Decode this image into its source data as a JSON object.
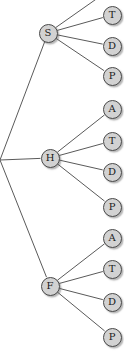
{
  "diagram": {
    "type": "tree",
    "orientation": "left-to-right",
    "canvas": {
      "width": 124,
      "height": 353
    },
    "style": {
      "background_color": "#ffffff",
      "node_fill_color": "#d2d2d2",
      "node_border_color": "#4a4a4a",
      "node_label_color": "#1a1a1a",
      "edge_color": "#5a5a5a",
      "edge_width": 1,
      "node_radius": 9.5,
      "shadow_color": "#5a5a5a"
    },
    "root": {
      "name": "root-junction",
      "visible": false,
      "x": 0,
      "y": 160
    },
    "nodes": [
      {
        "id": "S",
        "label": "S",
        "x": 48,
        "y": 33,
        "level": 1,
        "visible": true,
        "parent": "root-junction"
      },
      {
        "id": "H",
        "label": "H",
        "x": 50,
        "y": 158,
        "level": 1,
        "visible": true,
        "parent": "root-junction"
      },
      {
        "id": "F",
        "label": "F",
        "x": 50,
        "y": 286,
        "level": 1,
        "visible": true,
        "parent": "root-junction"
      },
      {
        "id": "S-A",
        "label": "A",
        "x": 112,
        "y": -12,
        "level": 2,
        "visible": false,
        "parent": "S"
      },
      {
        "id": "S-T",
        "label": "T",
        "x": 112,
        "y": 15,
        "level": 2,
        "visible": true,
        "parent": "S"
      },
      {
        "id": "S-D",
        "label": "D",
        "x": 112,
        "y": 46,
        "level": 2,
        "visible": true,
        "parent": "S"
      },
      {
        "id": "S-P",
        "label": "P",
        "x": 112,
        "y": 76,
        "level": 2,
        "visible": true,
        "parent": "S"
      },
      {
        "id": "H-A",
        "label": "A",
        "x": 112,
        "y": 109,
        "level": 2,
        "visible": true,
        "parent": "H"
      },
      {
        "id": "H-T",
        "label": "T",
        "x": 112,
        "y": 141,
        "level": 2,
        "visible": true,
        "parent": "H"
      },
      {
        "id": "H-D",
        "label": "D",
        "x": 112,
        "y": 172,
        "level": 2,
        "visible": true,
        "parent": "H"
      },
      {
        "id": "H-P",
        "label": "P",
        "x": 112,
        "y": 207,
        "level": 2,
        "visible": true,
        "parent": "H"
      },
      {
        "id": "F-A",
        "label": "A",
        "x": 112,
        "y": 238,
        "level": 2,
        "visible": true,
        "parent": "F"
      },
      {
        "id": "F-T",
        "label": "T",
        "x": 112,
        "y": 269,
        "level": 2,
        "visible": true,
        "parent": "F"
      },
      {
        "id": "F-D",
        "label": "D",
        "x": 112,
        "y": 302,
        "level": 2,
        "visible": true,
        "parent": "F"
      },
      {
        "id": "F-P",
        "label": "P",
        "x": 112,
        "y": 337,
        "level": 2,
        "visible": true,
        "parent": "F"
      }
    ],
    "edges": [
      {
        "from": "root-junction",
        "to": "S"
      },
      {
        "from": "root-junction",
        "to": "H"
      },
      {
        "from": "root-junction",
        "to": "F"
      },
      {
        "from": "S",
        "to": "S-A"
      },
      {
        "from": "S",
        "to": "S-T"
      },
      {
        "from": "S",
        "to": "S-D"
      },
      {
        "from": "S",
        "to": "S-P"
      },
      {
        "from": "H",
        "to": "H-A"
      },
      {
        "from": "H",
        "to": "H-T"
      },
      {
        "from": "H",
        "to": "H-D"
      },
      {
        "from": "H",
        "to": "H-P"
      },
      {
        "from": "F",
        "to": "F-A"
      },
      {
        "from": "F",
        "to": "F-T"
      },
      {
        "from": "F",
        "to": "F-D"
      },
      {
        "from": "F",
        "to": "F-P"
      }
    ]
  }
}
